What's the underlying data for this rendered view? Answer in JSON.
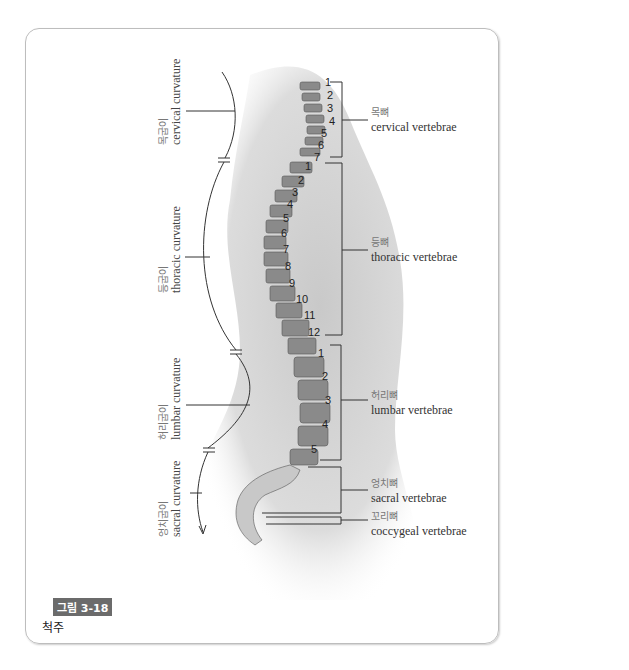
{
  "figure": {
    "badge": "그림 3-18",
    "caption": "척주"
  },
  "curvatures": [
    {
      "ko": "목굽이",
      "en": "cervical curvature"
    },
    {
      "ko": "등굽이",
      "en": "thoracic curvature"
    },
    {
      "ko": "허리굽이",
      "en": "lumbar curvature"
    },
    {
      "ko": "엉치굽이",
      "en": "sacral curvature"
    }
  ],
  "vertebrae_groups": [
    {
      "ko": "목뼈",
      "en": "cervical vertebrae",
      "count": 7
    },
    {
      "ko": "등뼈",
      "en": "thoracic vertebrae",
      "count": 12
    },
    {
      "ko": "허리뼈",
      "en": "lumbar vertebrae",
      "count": 5
    },
    {
      "ko": "엉치뼈",
      "en": "sacral vertebrae"
    },
    {
      "ko": "꼬리뼈",
      "en": "coccygeal vertebrae"
    }
  ],
  "numbers": {
    "cervical": [
      "1",
      "2",
      "3",
      "4",
      "5",
      "6",
      "7"
    ],
    "thoracic": [
      "1",
      "2",
      "3",
      "4",
      "5",
      "6",
      "7",
      "8",
      "9",
      "10",
      "11",
      "12"
    ],
    "lumbar": [
      "1",
      "2",
      "3",
      "4",
      "5"
    ]
  }
}
